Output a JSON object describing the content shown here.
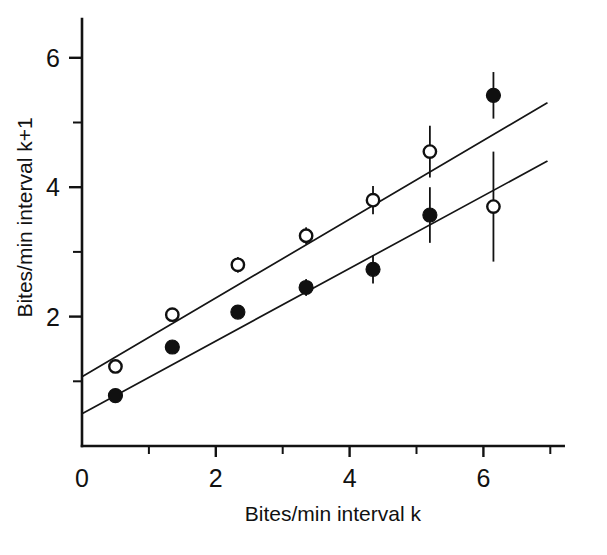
{
  "figure": {
    "background": "#ffffff",
    "ink_color": "#111111",
    "partial_caption": ""
  },
  "chart_data": {
    "type": "scatter",
    "title": "",
    "xlabel": "Bites/min interval k",
    "ylabel": "Bites/min interval k+1",
    "xlim": [
      0,
      7.2
    ],
    "ylim": [
      0,
      6.6
    ],
    "grid": false,
    "legend_position": "none",
    "x_major_ticks": [
      0,
      2,
      4,
      6
    ],
    "x_major_tick_labels": [
      "0",
      "2",
      "4",
      "6"
    ],
    "x_minor_ticks": [
      1,
      3,
      5,
      7
    ],
    "y_major_ticks": [
      2,
      4,
      6
    ],
    "y_major_tick_labels": [
      "2",
      "4",
      "6"
    ],
    "y_minor_ticks": [
      1,
      3,
      5
    ],
    "series": [
      {
        "name": "open-circles",
        "marker": "open-circle",
        "marker_color": "#ffffff",
        "edge_color": "#101010",
        "points": [
          {
            "x": 0.5,
            "y": 1.23,
            "yerr": 0.0
          },
          {
            "x": 1.35,
            "y": 2.03,
            "yerr": 0.0
          },
          {
            "x": 2.33,
            "y": 2.8,
            "yerr": 0.12
          },
          {
            "x": 3.35,
            "y": 3.25,
            "yerr": 0.13
          },
          {
            "x": 4.35,
            "y": 3.8,
            "yerr": 0.22
          },
          {
            "x": 5.2,
            "y": 4.55,
            "yerr": 0.4
          },
          {
            "x": 6.15,
            "y": 3.7,
            "yerr": 0.85
          }
        ],
        "fit_line": {
          "x0": 0.0,
          "y0": 1.07,
          "x1": 6.95,
          "y1": 5.3
        }
      },
      {
        "name": "filled-circles",
        "marker": "filled-circle",
        "marker_color": "#101010",
        "edge_color": "#101010",
        "points": [
          {
            "x": 0.5,
            "y": 0.78,
            "yerr": 0.0
          },
          {
            "x": 1.35,
            "y": 1.53,
            "yerr": 0.0
          },
          {
            "x": 2.33,
            "y": 2.07,
            "yerr": 0.1
          },
          {
            "x": 3.35,
            "y": 2.45,
            "yerr": 0.13
          },
          {
            "x": 4.35,
            "y": 2.73,
            "yerr": 0.22
          },
          {
            "x": 5.2,
            "y": 3.57,
            "yerr": 0.43
          },
          {
            "x": 6.15,
            "y": 5.42,
            "yerr": 0.36
          }
        ],
        "fit_line": {
          "x0": 0.0,
          "y0": 0.5,
          "x1": 6.95,
          "y1": 4.4
        }
      }
    ]
  }
}
